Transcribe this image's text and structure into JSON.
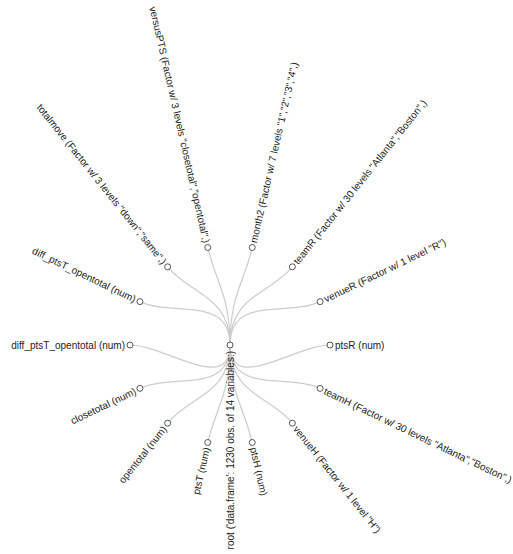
{
  "diagram": {
    "type": "radial-tree",
    "root": {
      "label": "root ('data.frame': 1230 obs. of 14 variables:)"
    },
    "children": [
      {
        "id": "ptsR",
        "label": "ptsR (num)"
      },
      {
        "id": "teamH",
        "label": "teamH (Factor w/ 30 levels \"Atlanta\",\"Boston\",)"
      },
      {
        "id": "venueH",
        "label": "venueH (Factor w/ 1 level \"H\")"
      },
      {
        "id": "ptsH",
        "label": "ptsH (num)"
      },
      {
        "id": "ptsT",
        "label": "ptsT (num)"
      },
      {
        "id": "opentotal",
        "label": "opentotal (num)"
      },
      {
        "id": "closetotal",
        "label": "closetotal (num)"
      },
      {
        "id": "diff_ptsT_opentotal_2",
        "label": "diff_ptsT_opentotal (num)"
      },
      {
        "id": "diff_ptsT_opentotal_1",
        "label": "diff_ptsT_opentotal (num)"
      },
      {
        "id": "totalmove",
        "label": "totalmove (Factor w/ 3 levels \"down\",\"same\",)"
      },
      {
        "id": "versusPTS",
        "label": "versusPTS (Factor w/ 3 levels \"closetotal\",\"opentotal\",)"
      },
      {
        "id": "month2",
        "label": "month2 (Factor w/ 7 levels \"1\",\"2\",\"3\",\"4\",)"
      },
      {
        "id": "teamR",
        "label": "teamR (Factor w/ 30 levels \"Atlanta\",\"Boston\",)"
      },
      {
        "id": "venueR",
        "label": "venueR (Factor w/ 1 level \"R\")"
      }
    ],
    "colors": {
      "link": "#cccccc",
      "node_stroke": "#555555",
      "text": "#222222"
    }
  }
}
